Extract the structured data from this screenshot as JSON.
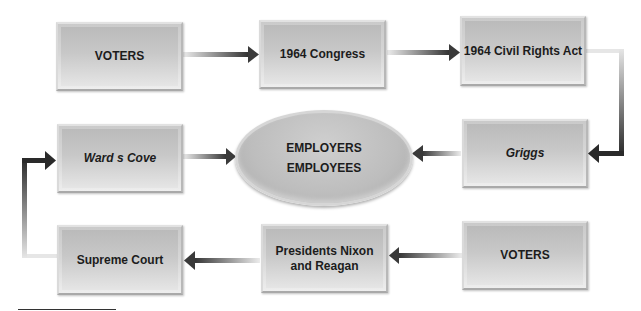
{
  "diagram": {
    "nodes": {
      "voters_top": "VOTERS",
      "congress_1964": "1964 Congress",
      "civil_rights_act": "1964 Civil Rights Act",
      "griggs": "Griggs",
      "employers": "EMPLOYERS",
      "employees": "EMPLOYEES",
      "wards_cove": "Ward s Cove",
      "voters_bottom": "VOTERS",
      "presidents_line1": "Presidents Nixon",
      "presidents_line2": "and Reagan",
      "supreme_court": "Supreme Court"
    },
    "edges": [
      {
        "from": "VOTERS",
        "to": "1964 Congress"
      },
      {
        "from": "1964 Congress",
        "to": "1964 Civil Rights Act"
      },
      {
        "from": "1964 Civil Rights Act",
        "to": "Griggs"
      },
      {
        "from": "Griggs",
        "to": "EMPLOYERS / EMPLOYEES"
      },
      {
        "from": "VOTERS",
        "to": "Presidents Nixon and Reagan"
      },
      {
        "from": "Presidents Nixon and Reagan",
        "to": "Supreme Court"
      },
      {
        "from": "Supreme Court",
        "to": "Ward s Cove"
      },
      {
        "from": "Ward s Cove",
        "to": "EMPLOYERS / EMPLOYEES"
      }
    ],
    "colors": {
      "box_fill": "#c4c4c4",
      "arrow_dark": "#2e2e2e",
      "arrow_light": "#e6e6e6",
      "text": "#1c1c1c"
    }
  }
}
